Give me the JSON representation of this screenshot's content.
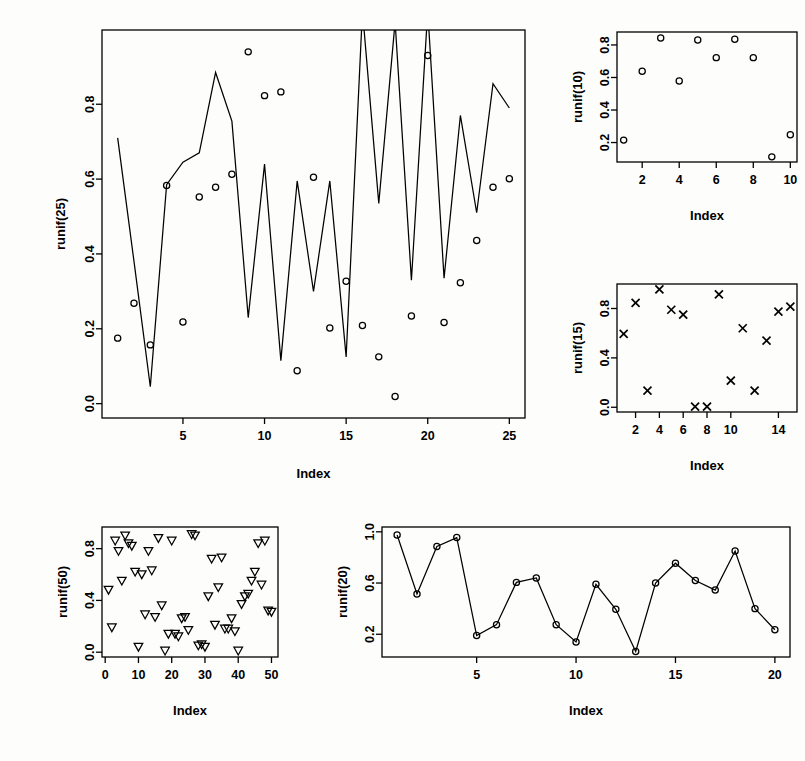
{
  "page": {
    "background": "#fdfdfc",
    "foreground": "#000000",
    "width": 805,
    "height": 761
  },
  "chart_data": [
    {
      "id": "runif25",
      "type": "line",
      "title": "",
      "xlabel": "Index",
      "ylabel": "runif(25)",
      "xlim": [
        1,
        25
      ],
      "ylim": [
        0.0,
        0.96
      ],
      "xticks": [
        5,
        10,
        15,
        20,
        25
      ],
      "yticks": [
        0.0,
        0.2,
        0.4,
        0.6,
        0.8
      ],
      "xticklabels": [
        "5",
        "10",
        "15",
        "20",
        "25"
      ],
      "yticklabels": [
        "0.0",
        "0.2",
        "0.4",
        "0.6",
        "0.8"
      ],
      "grid": false,
      "legend": "none",
      "x": [
        1,
        2,
        3,
        4,
        5,
        6,
        7,
        8,
        9,
        10,
        11,
        12,
        13,
        14,
        15,
        16,
        17,
        18,
        19,
        20,
        21,
        22,
        23,
        24,
        25
      ],
      "series": [
        {
          "name": "line",
          "marker": "none",
          "values": [
            0.71,
            0.38,
            0.045,
            0.585,
            0.645,
            0.67,
            0.885,
            0.755,
            0.23,
            0.64,
            0.115,
            0.595,
            0.3,
            0.595,
            0.125,
            1.05,
            0.535,
            1.02,
            0.33,
            1.05,
            0.335,
            0.77,
            0.51,
            0.855,
            0.79
          ]
        },
        {
          "name": "points",
          "marker": "circle",
          "values": [
            0.175,
            0.268,
            0.157,
            0.583,
            0.218,
            0.552,
            0.578,
            0.613,
            0.94,
            0.823,
            0.833,
            0.088,
            0.605,
            0.202,
            0.327,
            0.209,
            0.125,
            0.019,
            0.234,
            0.93,
            0.217,
            0.323,
            0.436,
            0.578,
            0.601
          ]
        }
      ]
    },
    {
      "id": "runif10",
      "type": "scatter",
      "title": "",
      "xlabel": "Index",
      "ylabel": "runif(10)",
      "xlim": [
        1,
        10
      ],
      "ylim": [
        0.11,
        0.85
      ],
      "xticks": [
        2,
        4,
        6,
        8,
        10
      ],
      "yticks": [
        0.2,
        0.4,
        0.6,
        0.8
      ],
      "xticklabels": [
        "2",
        "4",
        "6",
        "8",
        "10"
      ],
      "yticklabels": [
        "0.2",
        "0.4",
        "0.6",
        "0.8"
      ],
      "grid": false,
      "legend": "none",
      "marker": "circle",
      "x": [
        1,
        2,
        3,
        4,
        5,
        6,
        7,
        8,
        9,
        10
      ],
      "values": [
        0.215,
        0.638,
        0.843,
        0.578,
        0.83,
        0.722,
        0.835,
        0.722,
        0.112,
        0.248
      ]
    },
    {
      "id": "runif15",
      "type": "scatter",
      "title": "",
      "xlabel": "Index",
      "ylabel": "runif(15)",
      "xlim": [
        1,
        15
      ],
      "ylim": [
        0.0,
        0.96
      ],
      "xticks": [
        2,
        4,
        6,
        8,
        10,
        14
      ],
      "yticks": [
        0.0,
        0.4,
        0.8
      ],
      "xticklabels": [
        "2",
        "4",
        "6",
        "8",
        "10",
        "14"
      ],
      "yticklabels": [
        "0.0",
        "0.4",
        "0.8"
      ],
      "grid": false,
      "legend": "none",
      "marker": "cross",
      "x": [
        1,
        2,
        3,
        4,
        5,
        6,
        7,
        8,
        9,
        10,
        11,
        12,
        13,
        14,
        15
      ],
      "values": [
        0.595,
        0.845,
        0.135,
        0.955,
        0.79,
        0.75,
        0.005,
        0.005,
        0.915,
        0.215,
        0.64,
        0.135,
        0.54,
        0.775,
        0.815
      ]
    },
    {
      "id": "runif50",
      "type": "scatter",
      "title": "",
      "xlabel": "Index",
      "ylabel": "runif(50)",
      "xlim": [
        1,
        50
      ],
      "ylim": [
        0.0,
        0.93
      ],
      "xticks": [
        0,
        10,
        20,
        30,
        40,
        50
      ],
      "yticks": [
        0.0,
        0.4,
        0.8
      ],
      "xticklabels": [
        "0",
        "10",
        "20",
        "30",
        "40",
        "50"
      ],
      "yticklabels": [
        "0.0",
        "0.4",
        "0.8"
      ],
      "grid": false,
      "legend": "none",
      "marker": "triangle-down",
      "x": [
        1,
        2,
        3,
        4,
        5,
        6,
        7,
        8,
        9,
        10,
        11,
        12,
        13,
        14,
        15,
        16,
        17,
        18,
        19,
        20,
        21,
        22,
        23,
        24,
        25,
        26,
        27,
        28,
        29,
        30,
        31,
        32,
        33,
        34,
        35,
        36,
        37,
        38,
        39,
        40,
        41,
        42,
        43,
        44,
        45,
        46,
        47,
        48,
        49,
        50
      ],
      "values": [
        0.48,
        0.19,
        0.86,
        0.78,
        0.55,
        0.9,
        0.84,
        0.82,
        0.62,
        0.04,
        0.6,
        0.29,
        0.78,
        0.63,
        0.27,
        0.88,
        0.36,
        0.01,
        0.14,
        0.86,
        0.14,
        0.12,
        0.26,
        0.27,
        0.17,
        0.91,
        0.9,
        0.05,
        0.06,
        0.04,
        0.43,
        0.72,
        0.21,
        0.5,
        0.73,
        0.18,
        0.18,
        0.26,
        0.16,
        0.01,
        0.37,
        0.43,
        0.45,
        0.55,
        0.62,
        0.84,
        0.52,
        0.86,
        0.32,
        0.31
      ]
    },
    {
      "id": "runif20",
      "type": "line",
      "title": "",
      "xlabel": "Index",
      "ylabel": "runif(20)",
      "xlim": [
        1,
        20
      ],
      "ylim": [
        0.06,
        1.0
      ],
      "xticks": [
        5,
        10,
        15,
        20
      ],
      "yticks": [
        0.2,
        0.6,
        1.0
      ],
      "xticklabels": [
        "5",
        "10",
        "15",
        "20"
      ],
      "yticklabels": [
        "0.2",
        "0.6",
        "1.0"
      ],
      "grid": false,
      "legend": "none",
      "marker": "circle",
      "x": [
        1,
        2,
        3,
        4,
        5,
        6,
        7,
        8,
        9,
        10,
        11,
        12,
        13,
        14,
        15,
        16,
        17,
        18,
        19,
        20
      ],
      "values": [
        0.975,
        0.515,
        0.885,
        0.955,
        0.19,
        0.275,
        0.605,
        0.64,
        0.275,
        0.14,
        0.59,
        0.395,
        0.065,
        0.6,
        0.755,
        0.62,
        0.545,
        0.85,
        0.4,
        0.235
      ]
    }
  ],
  "panels": {
    "runif25": {
      "axis_label_x": "Index",
      "axis_label_y": "runif(25)"
    },
    "runif10": {
      "axis_label_x": "Index",
      "axis_label_y": "runif(10)"
    },
    "runif15": {
      "axis_label_x": "Index",
      "axis_label_y": "runif(15)"
    },
    "runif50": {
      "axis_label_x": "Index",
      "axis_label_y": "runif(50)"
    },
    "runif20": {
      "axis_label_x": "Index",
      "axis_label_y": "runif(20)"
    }
  }
}
